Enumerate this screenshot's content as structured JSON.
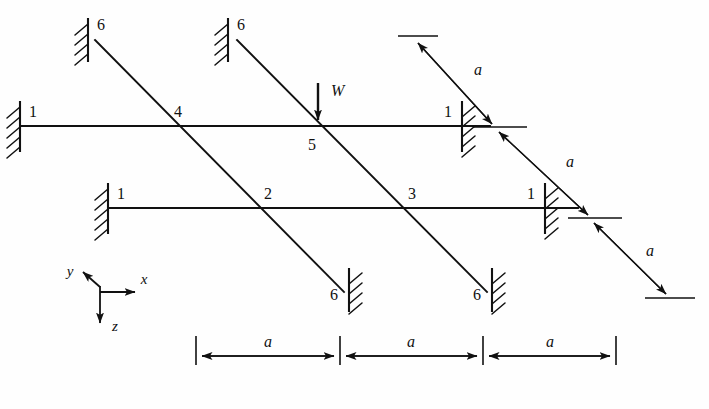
{
  "figure": {
    "type": "structural-diagram"
  },
  "load": {
    "label": "W",
    "direction": "down",
    "applied_at_node": "5"
  },
  "axes": {
    "x_label": "x",
    "y_label": "y",
    "z_label": "z"
  },
  "nodes": [
    {
      "id": "n1a",
      "label": "1",
      "x": 20,
      "y": 126,
      "kind": "fixed-support",
      "member": "upper-horizontal-beam",
      "side": "left"
    },
    {
      "id": "n1b",
      "label": "1",
      "x": 108,
      "y": 208,
      "kind": "fixed-support",
      "member": "lower-horizontal-beam",
      "side": "left"
    },
    {
      "id": "n1c",
      "label": "1",
      "x": 462,
      "y": 126,
      "kind": "fixed-support",
      "member": "upper-horizontal-beam",
      "side": "right"
    },
    {
      "id": "n1d",
      "label": "1",
      "x": 545,
      "y": 208,
      "kind": "fixed-support",
      "member": "lower-horizontal-beam",
      "side": "right"
    },
    {
      "id": "n2",
      "label": "2",
      "x": 262,
      "y": 208,
      "kind": "joint",
      "member": "diagonal-beam-1"
    },
    {
      "id": "n3",
      "label": "3",
      "x": 172,
      "y": 126,
      "kind": "joint",
      "member": "diagonal-beam-1"
    },
    {
      "id": "n4",
      "label": "4",
      "x": 405,
      "y": 208,
      "kind": "joint",
      "member": "diagonal-beam-2"
    },
    {
      "id": "n5",
      "label": "5",
      "x": 318,
      "y": 126,
      "kind": "joint",
      "member": "diagonal-beam-2"
    },
    {
      "id": "n6a",
      "label": "6",
      "x": 95,
      "y": 40,
      "kind": "fixed-support",
      "member": "diagonal-beam-1",
      "side": "top"
    },
    {
      "id": "n6b",
      "label": "6",
      "x": 237,
      "y": 40,
      "kind": "fixed-support",
      "member": "diagonal-beam-2",
      "side": "top"
    },
    {
      "id": "n6c",
      "label": "6",
      "x": 342,
      "y": 288,
      "kind": "fixed-support",
      "member": "diagonal-beam-1",
      "side": "bottom"
    },
    {
      "id": "n6d",
      "label": "6",
      "x": 485,
      "y": 288,
      "kind": "fixed-support",
      "member": "diagonal-beam-2",
      "side": "bottom"
    }
  ],
  "dimensions": {
    "bottom_chain": {
      "orientation": "horizontal",
      "segments": [
        {
          "label": "a"
        },
        {
          "label": "a"
        },
        {
          "label": "a"
        }
      ]
    },
    "diagonal_chain": {
      "orientation": "diagonal",
      "segments": [
        {
          "label": "a"
        },
        {
          "label": "a"
        },
        {
          "label": "a"
        }
      ]
    }
  }
}
